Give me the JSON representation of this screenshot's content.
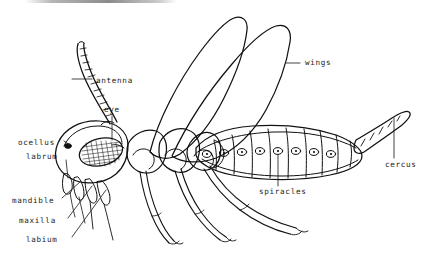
{
  "figure": {
    "style": "black ink line drawing on white background",
    "colors": {
      "ink": "#111111",
      "background": "#ffffff",
      "label_text": "#1a1a1a",
      "leader_line": "#222222",
      "scan_artifact": "#6e6e6e"
    }
  },
  "labels": [
    {
      "id": "antenna",
      "text": "antenna",
      "side": "left",
      "x": 96,
      "y": 81
    },
    {
      "id": "eye",
      "text": "eye",
      "side": "left",
      "x": 104,
      "y": 110
    },
    {
      "id": "ocellus",
      "text": "ocellus",
      "side": "left",
      "x": 18,
      "y": 143
    },
    {
      "id": "labrum",
      "text": "labrum",
      "side": "left",
      "x": 26,
      "y": 157
    },
    {
      "id": "mandible",
      "text": "mandible",
      "side": "left",
      "x": 12,
      "y": 201
    },
    {
      "id": "maxilla",
      "text": "maxilla",
      "side": "left",
      "x": 19,
      "y": 221
    },
    {
      "id": "labium",
      "text": "labium",
      "side": "left",
      "x": 26,
      "y": 240
    },
    {
      "id": "wings",
      "text": "wings",
      "side": "right",
      "x": 305,
      "y": 66
    },
    {
      "id": "spiracles",
      "text": "spiracles",
      "side": "right",
      "x": 259,
      "y": 192
    },
    {
      "id": "cercus",
      "text": "cercus",
      "side": "right",
      "x": 385,
      "y": 165
    }
  ],
  "parts": [
    {
      "id": "antenna",
      "name": "antenna",
      "description": "long segmented ladder-like appendage curving up from head"
    },
    {
      "id": "eye",
      "name": "compound eye",
      "description": "large stippled oval on side of head"
    },
    {
      "id": "ocellus",
      "name": "ocellus",
      "description": "small simple eye dot on front of head"
    },
    {
      "id": "labrum",
      "name": "labrum",
      "description": "upper lip flap of mouthparts"
    },
    {
      "id": "mandible",
      "name": "mandible",
      "description": "chewing jaw below labrum"
    },
    {
      "id": "maxilla",
      "name": "maxilla",
      "description": "secondary jaw with palp"
    },
    {
      "id": "labium",
      "name": "labium",
      "description": "lower lip of mouthparts"
    },
    {
      "id": "wings",
      "name": "wings",
      "description": "pair of elongated wings raised above thorax"
    },
    {
      "id": "spiracles",
      "name": "spiracles",
      "description": "row of small oval breathing pores along abdomen"
    },
    {
      "id": "cercus",
      "name": "cercus",
      "description": "segmented appendage at tip of abdomen"
    },
    {
      "id": "thorax",
      "name": "thorax",
      "description": "three segments bearing legs and wings"
    },
    {
      "id": "abdomen",
      "name": "abdomen",
      "description": "segmented tapering rear body"
    },
    {
      "id": "legs",
      "name": "legs",
      "description": "three pairs of legs with tarsal claws"
    }
  ],
  "counts": {
    "wings": 2,
    "leg_pairs": 3,
    "spiracles_visible": 8,
    "abdomen_segments": 10
  }
}
